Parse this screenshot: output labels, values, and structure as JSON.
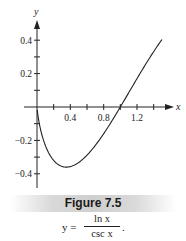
{
  "chart_data": {
    "type": "line",
    "title": "Figure 7.5",
    "caption_formula": {
      "lhs": "y =",
      "numerator": "ln x",
      "denominator": "csc x",
      "trailing": "."
    },
    "xlabel": "x",
    "ylabel": "y",
    "xlim": [
      0,
      1.6
    ],
    "ylim": [
      -0.48,
      0.5
    ],
    "x_ticks": [
      0.2,
      0.4,
      0.6,
      0.8,
      1.0,
      1.2,
      1.4
    ],
    "x_tick_labels": [
      "0.4",
      "0.8",
      "1.2"
    ],
    "y_ticks": [
      0.4,
      0.3,
      0.2,
      0.1,
      -0.1,
      -0.2,
      -0.3,
      -0.4
    ],
    "y_tick_labels": [
      "0.4",
      "0.2",
      "−0.2",
      "−0.4"
    ],
    "grid": false,
    "legend": null,
    "series": [
      {
        "name": "y = ln x / csc x",
        "x": [
          0.02,
          0.05,
          0.1,
          0.15,
          0.2,
          0.25,
          0.3,
          0.35,
          0.4,
          0.5,
          0.6,
          0.7,
          0.8,
          0.9,
          1.0,
          1.1,
          1.2,
          1.3,
          1.4,
          1.5
        ],
        "y": [
          -0.08,
          -0.15,
          -0.23,
          -0.28,
          -0.32,
          -0.34,
          -0.36,
          -0.36,
          -0.36,
          -0.33,
          -0.29,
          -0.23,
          -0.16,
          -0.08,
          0.0,
          0.08,
          0.17,
          0.25,
          0.33,
          0.4
        ]
      }
    ]
  },
  "figure": {
    "label": "Figure 7.5",
    "band_color": "#cfcfcf",
    "line_color": "#222222"
  }
}
